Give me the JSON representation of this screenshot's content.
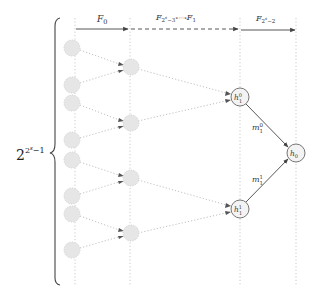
{
  "diagram": {
    "brace_label": {
      "base": "2",
      "exp": "2",
      "exp_sup": "s",
      "exp_tail": "−1"
    },
    "top_labels": [
      {
        "id": "F0",
        "main": "F",
        "sub": "0"
      },
      {
        "id": "Fmid",
        "main": "F",
        "sub": "2",
        "sub_sup": "s",
        "sub_tail": "−3",
        "compose": "∘···∘",
        "main2": "F",
        "sub2": "1"
      },
      {
        "id": "Flast",
        "main": "F",
        "sub": "2",
        "sub_sup": "s",
        "sub_tail": "−2"
      }
    ],
    "nodes": {
      "h10": {
        "main": "h",
        "sup": "0",
        "sub": "1"
      },
      "h11": {
        "main": "h",
        "sup": "1",
        "sub": "1"
      },
      "h0": {
        "main": "h",
        "sub": "0"
      }
    },
    "edge_labels": {
      "m10": {
        "main": "m",
        "sup": "0",
        "sub": "1"
      },
      "m11": {
        "main": "m",
        "sup": "1",
        "sub": "1"
      }
    },
    "colors": {
      "line": "#555555",
      "dotted": "#aaaaaa",
      "faded_node_fill": "#e8e8e8",
      "node_stroke": "#666666",
      "node_fill": "#f2f2f2"
    }
  }
}
